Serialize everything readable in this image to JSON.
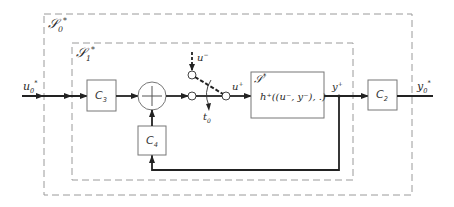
{
  "diagram": {
    "colors": {
      "line": "#222222",
      "box": "#777777",
      "dash": "#999999",
      "background": "#ffffff"
    },
    "groups": [
      {
        "id": "S0",
        "label": "𝒮₀*",
        "label_main": "𝒮",
        "label_sub": "0",
        "label_sup": "*"
      },
      {
        "id": "S1",
        "label": "𝒮₁*",
        "label_main": "𝒮",
        "label_sub": "1",
        "label_sup": "*"
      }
    ],
    "blocks": [
      {
        "id": "C3",
        "main": "C",
        "sub": "3"
      },
      {
        "id": "C4",
        "main": "C",
        "sub": "4"
      },
      {
        "id": "C2",
        "main": "C",
        "sub": "2"
      },
      {
        "id": "plant",
        "title_main": "𝒮",
        "title_sup": "*",
        "function": "h⁺((u⁻, y⁻), .)"
      }
    ],
    "summing_junction": {
      "symbol": "+"
    },
    "signals": {
      "input": {
        "main": "u",
        "sub": "0",
        "sup": "*"
      },
      "switch_alt_input": {
        "main": "u",
        "sup": "−"
      },
      "switch_output": {
        "main": "u",
        "sup": "+"
      },
      "plant_output": {
        "main": "y",
        "sup": "+"
      },
      "output": {
        "main": "y",
        "sub": "0",
        "sup": "*"
      },
      "switch_time": {
        "main": "t",
        "sub": "0"
      }
    }
  }
}
